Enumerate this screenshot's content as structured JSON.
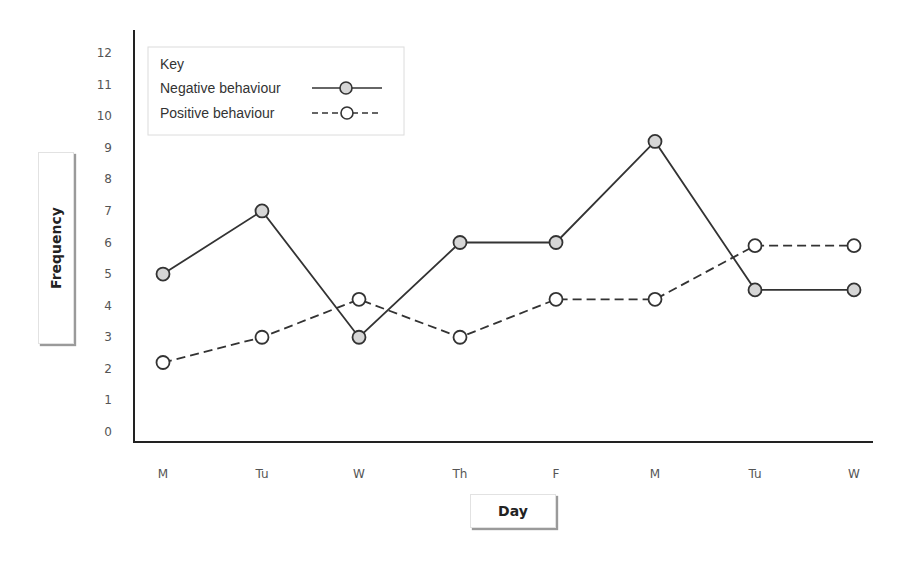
{
  "chart_data": {
    "type": "line",
    "title": "",
    "xlabel": "Day",
    "ylabel": "Frequency",
    "categories": [
      "M",
      "Tu",
      "W",
      "Th",
      "F",
      "M",
      "Tu",
      "W"
    ],
    "ylim": [
      0,
      12
    ],
    "yticks": [
      0,
      1,
      2,
      3,
      4,
      5,
      6,
      7,
      8,
      9,
      10,
      11,
      12
    ],
    "grid": false,
    "legend": {
      "title": "Key",
      "position": "top-left",
      "entries": [
        "Negative behaviour",
        "Positive behaviour"
      ]
    },
    "series": [
      {
        "name": "Negative behaviour",
        "style": "solid",
        "marker": "circle-filled-grey",
        "values": [
          5,
          7,
          3,
          6,
          6,
          9.2,
          4.5,
          4.5
        ]
      },
      {
        "name": "Positive behaviour",
        "style": "dashed",
        "marker": "circle-open",
        "values": [
          2.2,
          3,
          4.2,
          3,
          4.2,
          4.2,
          5.9,
          5.9
        ]
      }
    ]
  },
  "colors": {
    "line": "#333333",
    "marker_fill_negative": "#d6d6d6",
    "marker_fill_positive": "#ffffff",
    "axis": "#222222",
    "tick_text": "#555555"
  }
}
